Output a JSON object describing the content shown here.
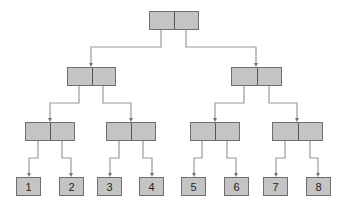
{
  "diagram": {
    "title": "",
    "colors": {
      "node_fill": "#c4c4c4",
      "node_border": "#6e6e6e",
      "edge": "#9a9a9a"
    },
    "internal_nodes": [
      {
        "id": "root",
        "x": 149,
        "y": 11,
        "w": 50,
        "h": 19
      },
      {
        "id": "L",
        "x": 67,
        "y": 67,
        "w": 49,
        "h": 19
      },
      {
        "id": "R",
        "x": 231,
        "y": 67,
        "w": 51,
        "h": 19
      },
      {
        "id": "LL",
        "x": 25,
        "y": 122,
        "w": 50,
        "h": 19
      },
      {
        "id": "LR",
        "x": 106,
        "y": 122,
        "w": 50,
        "h": 19
      },
      {
        "id": "RL",
        "x": 190,
        "y": 122,
        "w": 50,
        "h": 19
      },
      {
        "id": "RR",
        "x": 272,
        "y": 122,
        "w": 51,
        "h": 19
      }
    ],
    "leaves": [
      {
        "label": "1",
        "x": 16,
        "y": 177,
        "w": 25,
        "h": 19
      },
      {
        "label": "2",
        "x": 59,
        "y": 177,
        "w": 25,
        "h": 19
      },
      {
        "label": "3",
        "x": 97,
        "y": 177,
        "w": 25,
        "h": 19
      },
      {
        "label": "4",
        "x": 139,
        "y": 177,
        "w": 25,
        "h": 19
      },
      {
        "label": "5",
        "x": 181,
        "y": 177,
        "w": 25,
        "h": 19
      },
      {
        "label": "6",
        "x": 224,
        "y": 177,
        "w": 25,
        "h": 19
      },
      {
        "label": "7",
        "x": 263,
        "y": 177,
        "w": 25,
        "h": 19
      },
      {
        "label": "8",
        "x": 306,
        "y": 177,
        "w": 25,
        "h": 19
      }
    ],
    "edges": [
      {
        "from": [
          161,
          30
        ],
        "mid_y": 47,
        "to": [
          91,
          67
        ]
      },
      {
        "from": [
          186,
          30
        ],
        "mid_y": 47,
        "to": [
          256,
          67
        ]
      },
      {
        "from": [
          79,
          86
        ],
        "mid_y": 103,
        "to": [
          50,
          122
        ]
      },
      {
        "from": [
          103,
          86
        ],
        "mid_y": 103,
        "to": [
          131,
          122
        ]
      },
      {
        "from": [
          244,
          86
        ],
        "mid_y": 103,
        "to": [
          215,
          122
        ]
      },
      {
        "from": [
          269,
          86
        ],
        "mid_y": 103,
        "to": [
          297,
          122
        ]
      },
      {
        "from": [
          38,
          141
        ],
        "mid_y": 158,
        "to": [
          29,
          177
        ]
      },
      {
        "from": [
          62,
          141
        ],
        "mid_y": 158,
        "to": [
          71,
          177
        ]
      },
      {
        "from": [
          119,
          141
        ],
        "mid_y": 158,
        "to": [
          110,
          177
        ]
      },
      {
        "from": [
          143,
          141
        ],
        "mid_y": 158,
        "to": [
          152,
          177
        ]
      },
      {
        "from": [
          202,
          141
        ],
        "mid_y": 158,
        "to": [
          194,
          177
        ]
      },
      {
        "from": [
          227,
          141
        ],
        "mid_y": 158,
        "to": [
          236,
          177
        ]
      },
      {
        "from": [
          285,
          141
        ],
        "mid_y": 158,
        "to": [
          276,
          177
        ]
      },
      {
        "from": [
          310,
          141
        ],
        "mid_y": 158,
        "to": [
          318,
          177
        ]
      }
    ]
  }
}
